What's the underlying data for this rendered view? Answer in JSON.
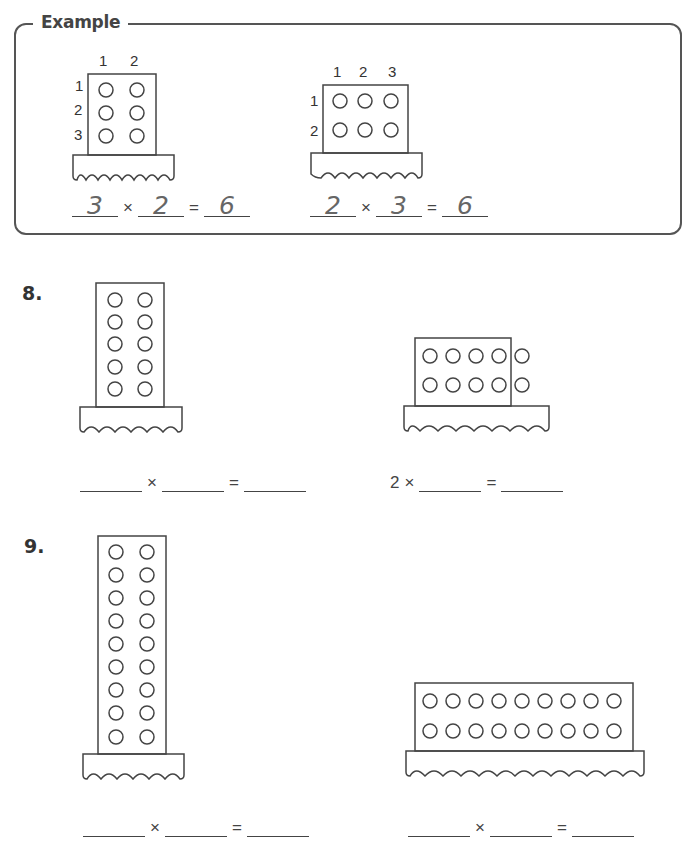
{
  "example": {
    "title": "Example",
    "left": {
      "col_labels": [
        "1",
        "2"
      ],
      "row_labels": [
        "1",
        "2",
        "3"
      ],
      "rows": 3,
      "cols": 2,
      "equation": {
        "a": "3",
        "times": "×",
        "b": "2",
        "equals": "=",
        "result": "6"
      }
    },
    "right": {
      "col_labels": [
        "1",
        "2",
        "3"
      ],
      "row_labels": [
        "1",
        "2"
      ],
      "rows": 2,
      "cols": 3,
      "equation": {
        "a": "2",
        "times": "×",
        "b": "3",
        "equals": "=",
        "result": "6"
      }
    }
  },
  "problems": [
    {
      "number": "8.",
      "left": {
        "rows": 5,
        "cols": 2,
        "equation": {
          "a": "",
          "times": "×",
          "b": "",
          "equals": "=",
          "result": ""
        }
      },
      "right": {
        "rows": 2,
        "cols": 5,
        "equation": {
          "a": "2",
          "times": "×",
          "b": "",
          "equals": "=",
          "result": ""
        }
      }
    },
    {
      "number": "9.",
      "left": {
        "rows": 9,
        "cols": 2,
        "equation": {
          "a": "",
          "times": "×",
          "b": "",
          "equals": "=",
          "result": ""
        }
      },
      "right": {
        "rows": 2,
        "cols": 9,
        "equation": {
          "a": "",
          "times": "×",
          "b": "",
          "equals": "=",
          "result": ""
        }
      }
    }
  ],
  "colors": {
    "stroke": "#444444",
    "handwriting": "#666666",
    "background": "#ffffff"
  }
}
